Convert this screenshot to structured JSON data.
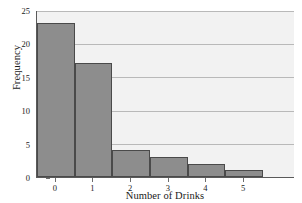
{
  "chart_data": {
    "type": "bar",
    "title": "",
    "subtitle": "",
    "xlabel": "Number of Drinks",
    "ylabel": "Frequency",
    "categories": [
      "0",
      "1",
      "2",
      "3",
      "4",
      "5"
    ],
    "values": [
      23,
      17,
      4,
      3,
      2,
      1
    ],
    "series": [
      {
        "name": "Frequency",
        "values": [
          23,
          17,
          4,
          3,
          2,
          1
        ]
      }
    ],
    "ylim": [
      0,
      25
    ],
    "yticks": [
      0,
      5,
      10,
      15,
      20,
      25
    ],
    "ytick_labels": [
      "0",
      "5",
      "10",
      "15",
      "20",
      "25"
    ],
    "xticks": [
      0,
      1,
      2,
      3,
      4,
      5
    ],
    "xtick_labels": [
      "0",
      "1",
      "2",
      "3",
      "4",
      "5"
    ],
    "grid": "horizontal",
    "legend": "none",
    "annotations": [],
    "colors": {
      "bar_fill": "#8d8d8d",
      "bar_edge": "#4a4a4a",
      "plot_background": "#f2f2f2",
      "gridline": "#b9b9b9",
      "axis": "#5a5a5a",
      "text": "#1a1a1a",
      "figure_background": "#ffffff"
    }
  }
}
